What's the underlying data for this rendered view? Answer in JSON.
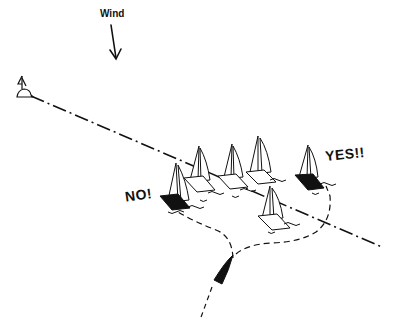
{
  "diagram": {
    "type": "sailing-start-line-illustration",
    "wind": {
      "label": "Wind",
      "direction": "from top, pointing down"
    },
    "annotations": {
      "bad_start": "NO!",
      "good_start": "YES!!"
    },
    "elements": {
      "start_mark": "buoy-with-flag",
      "start_line": "dash-dot line from upper-left buoy to lower-right",
      "fleet_count": 6,
      "highlighted_boats": [
        "bad-start-boat (left, black hull)",
        "good-start-boat (right, black hull)"
      ],
      "approaching_boat": "black hull at bottom with dashed course lines"
    },
    "colors": {
      "ink": "#111111",
      "background": "#ffffff"
    }
  }
}
